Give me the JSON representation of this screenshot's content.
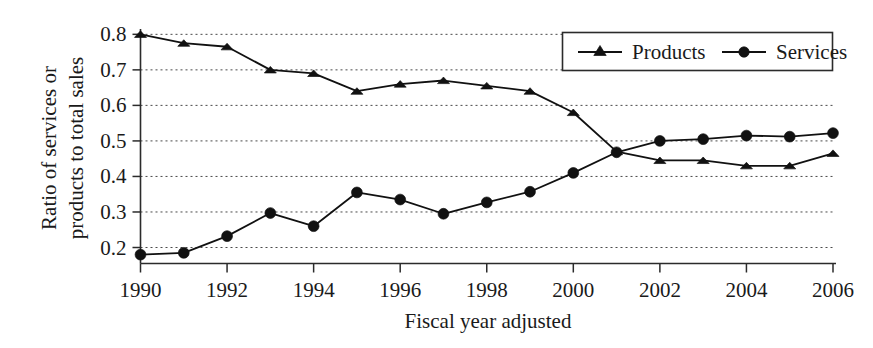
{
  "chart_data": {
    "type": "line",
    "title": "",
    "xlabel": "Fiscal year adjusted",
    "ylabel": "Ratio of services or products to total sales",
    "ylabel_line1": "Ratio of services or",
    "ylabel_line2": "products to total sales",
    "x": [
      1990,
      1991,
      1992,
      1993,
      1994,
      1995,
      1996,
      1997,
      1998,
      1999,
      2000,
      2001,
      2002,
      2003,
      2004,
      2005,
      2006
    ],
    "xtick_labels": [
      "1990",
      "1992",
      "1994",
      "1996",
      "1998",
      "2000",
      "2002",
      "2004",
      "2006"
    ],
    "xtick_values": [
      1990,
      1992,
      1994,
      1996,
      1998,
      2000,
      2002,
      2004,
      2006
    ],
    "ytick_labels": [
      "0.2",
      "0.3",
      "0.4",
      "0.5",
      "0.6",
      "0.7",
      "0.8"
    ],
    "ytick_values": [
      0.2,
      0.3,
      0.4,
      0.5,
      0.6,
      0.7,
      0.8
    ],
    "xlim": [
      1990,
      2006
    ],
    "ylim": [
      0.155,
      0.815
    ],
    "grid": true,
    "grid_axis": "y",
    "legend_position": "top-right",
    "series": [
      {
        "name": "Products",
        "marker": "triangle",
        "color": "#111111",
        "values": [
          0.8,
          0.775,
          0.765,
          0.7,
          0.69,
          0.64,
          0.66,
          0.67,
          0.655,
          0.64,
          0.58,
          0.47,
          0.445,
          0.445,
          0.43,
          0.43,
          0.465
        ]
      },
      {
        "name": "Services",
        "marker": "circle",
        "color": "#111111",
        "values": [
          0.18,
          0.185,
          0.232,
          0.297,
          0.26,
          0.355,
          0.335,
          0.295,
          0.327,
          0.357,
          0.41,
          0.468,
          0.5,
          0.505,
          0.515,
          0.512,
          0.522
        ]
      }
    ]
  },
  "legend": {
    "items": [
      {
        "label": "Products"
      },
      {
        "label": "Services"
      }
    ]
  },
  "axes": {
    "x_title": "Fiscal year adjusted",
    "y_title_line1": "Ratio of services or",
    "y_title_line2": "products to total sales"
  }
}
